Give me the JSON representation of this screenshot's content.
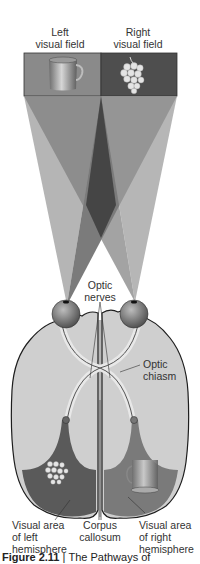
{
  "diagram": {
    "type": "anatomical"
  },
  "labels": {
    "left_field": [
      "Left",
      "visual field"
    ],
    "right_field": [
      "Right",
      "visual field"
    ],
    "optic_nerves": [
      "Optic",
      "nerves"
    ],
    "optic_chiasm": [
      "Optic",
      "chiasm"
    ],
    "visual_left": [
      "Visual area",
      "of left",
      "hemisphere"
    ],
    "corpus": [
      "Corpus",
      "callosum"
    ],
    "visual_right": [
      "Visual area",
      "of right",
      "hemisphere"
    ]
  },
  "objects": {
    "left_field_object": "cup",
    "right_field_object": "grapes",
    "left_hemisphere_object": "grapes",
    "right_hemisphere_object": "cup"
  },
  "caption": {
    "figure": "Figure 2.11",
    "separator": "|",
    "text": "The Pathways of"
  },
  "colors": {
    "left_field_bg": "#8a8a8a",
    "right_field_bg": "#4e4e4e",
    "brain_fill": "#cfcfcf",
    "visual_area_left": "#5a5a5a",
    "visual_area_right": "#7a7a7a",
    "outline": "#1e1e1e"
  }
}
